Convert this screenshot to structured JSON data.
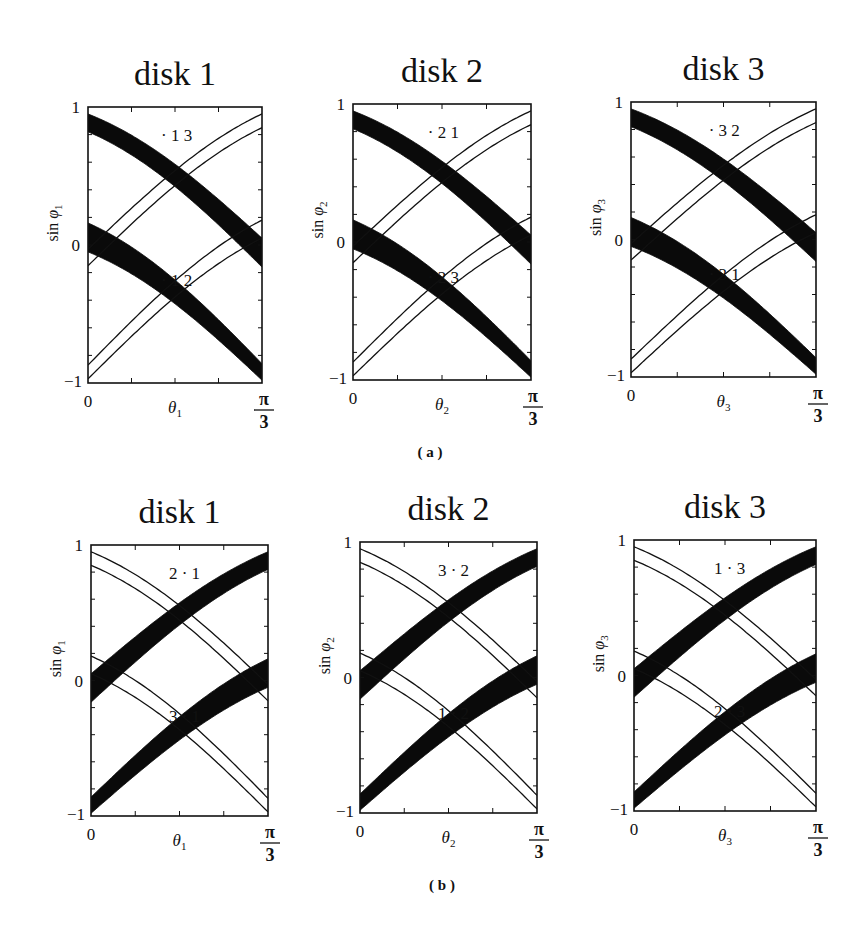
{
  "figure": {
    "captions": [
      {
        "id": "a",
        "text": "( a )",
        "x": 430,
        "y": 457
      },
      {
        "id": "b",
        "text": "( b )",
        "x": 442,
        "y": 890
      }
    ]
  },
  "chart_data": [
    {
      "type": "line",
      "panel_id": "a1",
      "row": "a",
      "title": "disk 1",
      "xlabel": "θ1",
      "xlabel_base": "θ",
      "xlabel_sub": "1",
      "ylabel": "sin φ1",
      "ylabel_base": "sin φ",
      "ylabel_sub": "1",
      "xlim": [
        0,
        "π/3"
      ],
      "ylim": [
        -1,
        1
      ],
      "xtick_labels": [
        "0",
        "π/3"
      ],
      "ytick_labels": [
        "1",
        "0",
        "−1"
      ],
      "x_ticks_count": 5,
      "y_ticks_count": 11,
      "frame": {
        "x": 88,
        "y": 107,
        "w": 174,
        "h": 276
      },
      "annotations": [
        {
          "text": "· 1 3",
          "x": 0.42,
          "y": 0.8
        },
        {
          "text": "· 1 2",
          "x": 0.42,
          "y": -0.25
        }
      ],
      "series": [
        {
          "name": "thick band upper",
          "kind": "band",
          "dir": "down",
          "y0": [
            0.95,
            0.82
          ],
          "y1": [
            0.05,
            -0.16
          ]
        },
        {
          "name": "thick band lower",
          "kind": "band",
          "dir": "down",
          "y0": [
            0.16,
            -0.05
          ],
          "y1": [
            -0.86,
            -0.98
          ]
        },
        {
          "name": "thin line upper A",
          "kind": "line",
          "dir": "up",
          "y0": -0.03,
          "y1": 0.95
        },
        {
          "name": "thin line upper B",
          "kind": "line",
          "dir": "up",
          "y0": -0.15,
          "y1": 0.85
        },
        {
          "name": "thin line lower A",
          "kind": "line",
          "dir": "up",
          "y0": -0.87,
          "y1": 0.18
        },
        {
          "name": "thin line lower B",
          "kind": "line",
          "dir": "up",
          "y0": -0.97,
          "y1": 0.05
        }
      ]
    },
    {
      "type": "line",
      "panel_id": "a2",
      "row": "a",
      "title": "disk 2",
      "xlabel": "θ2",
      "xlabel_base": "θ",
      "xlabel_sub": "2",
      "ylabel": "sin φ2",
      "ylabel_base": "sin φ",
      "ylabel_sub": "2",
      "xlim": [
        0,
        "π/3"
      ],
      "ylim": [
        -1,
        1
      ],
      "xtick_labels": [
        "0",
        "π/3"
      ],
      "ytick_labels": [
        "1",
        "0",
        "−1"
      ],
      "x_ticks_count": 5,
      "y_ticks_count": 11,
      "frame": {
        "x": 353,
        "y": 104,
        "w": 178,
        "h": 276
      },
      "annotations": [
        {
          "text": "· 2 1",
          "x": 0.42,
          "y": 0.8
        },
        {
          "text": "· 2 3",
          "x": 0.42,
          "y": -0.25
        }
      ],
      "series": [
        {
          "name": "thick band upper",
          "kind": "band",
          "dir": "down",
          "y0": [
            0.95,
            0.82
          ],
          "y1": [
            0.05,
            -0.16
          ]
        },
        {
          "name": "thick band lower",
          "kind": "band",
          "dir": "down",
          "y0": [
            0.16,
            -0.05
          ],
          "y1": [
            -0.86,
            -0.98
          ]
        },
        {
          "name": "thin line upper A",
          "kind": "line",
          "dir": "up",
          "y0": -0.03,
          "y1": 0.95
        },
        {
          "name": "thin line upper B",
          "kind": "line",
          "dir": "up",
          "y0": -0.15,
          "y1": 0.85
        },
        {
          "name": "thin line lower A",
          "kind": "line",
          "dir": "up",
          "y0": -0.87,
          "y1": 0.18
        },
        {
          "name": "thin line lower B",
          "kind": "line",
          "dir": "up",
          "y0": -0.97,
          "y1": 0.05
        }
      ]
    },
    {
      "type": "line",
      "panel_id": "a3",
      "row": "a",
      "title": "disk 3",
      "xlabel": "θ3",
      "xlabel_base": "θ",
      "xlabel_sub": "3",
      "ylabel": "sin φ3",
      "ylabel_base": "sin φ",
      "ylabel_sub": "3",
      "xlim": [
        0,
        "π/3"
      ],
      "ylim": [
        -1,
        1
      ],
      "xtick_labels": [
        "0",
        "π/3"
      ],
      "ytick_labels": [
        "1",
        "0",
        "−1"
      ],
      "x_ticks_count": 5,
      "y_ticks_count": 11,
      "frame": {
        "x": 631,
        "y": 102,
        "w": 185,
        "h": 275
      },
      "annotations": [
        {
          "text": "· 3 2",
          "x": 0.42,
          "y": 0.8
        },
        {
          "text": "· 3 1",
          "x": 0.42,
          "y": -0.25
        }
      ],
      "series": [
        {
          "name": "thick band upper",
          "kind": "band",
          "dir": "down",
          "y0": [
            0.95,
            0.82
          ],
          "y1": [
            0.05,
            -0.16
          ]
        },
        {
          "name": "thick band lower",
          "kind": "band",
          "dir": "down",
          "y0": [
            0.16,
            -0.05
          ],
          "y1": [
            -0.86,
            -0.98
          ]
        },
        {
          "name": "thin line upper A",
          "kind": "line",
          "dir": "up",
          "y0": -0.03,
          "y1": 0.95
        },
        {
          "name": "thin line upper B",
          "kind": "line",
          "dir": "up",
          "y0": -0.15,
          "y1": 0.85
        },
        {
          "name": "thin line lower A",
          "kind": "line",
          "dir": "up",
          "y0": -0.87,
          "y1": 0.18
        },
        {
          "name": "thin line lower B",
          "kind": "line",
          "dir": "up",
          "y0": -0.97,
          "y1": 0.05
        }
      ]
    },
    {
      "type": "line",
      "panel_id": "b1",
      "row": "b",
      "title": "disk 1",
      "xlabel": "θ1",
      "xlabel_base": "θ",
      "xlabel_sub": "1",
      "ylabel": "sin φ1",
      "ylabel_base": "sin φ",
      "ylabel_sub": "1",
      "xlim": [
        0,
        "π/3"
      ],
      "ylim": [
        -1,
        1
      ],
      "xtick_labels": [
        "0",
        "π/3"
      ],
      "ytick_labels": [
        "1",
        "0",
        "−1"
      ],
      "x_ticks_count": 5,
      "y_ticks_count": 11,
      "frame": {
        "x": 91,
        "y": 545,
        "w": 177,
        "h": 271
      },
      "annotations": [
        {
          "text": "2 · 1",
          "x": 0.44,
          "y": 0.79
        },
        {
          "text": "3 · 1",
          "x": 0.44,
          "y": -0.26
        }
      ],
      "series": [
        {
          "name": "thick band upper",
          "kind": "band",
          "dir": "up",
          "y0": [
            0.05,
            -0.16
          ],
          "y1": [
            0.95,
            0.82
          ]
        },
        {
          "name": "thick band lower",
          "kind": "band",
          "dir": "up",
          "y0": [
            -0.86,
            -0.98
          ],
          "y1": [
            0.16,
            -0.05
          ]
        },
        {
          "name": "thin line upper A",
          "kind": "line",
          "dir": "down",
          "y0": 0.95,
          "y1": -0.03
        },
        {
          "name": "thin line upper B",
          "kind": "line",
          "dir": "down",
          "y0": 0.85,
          "y1": -0.15
        },
        {
          "name": "thin line lower A",
          "kind": "line",
          "dir": "down",
          "y0": 0.18,
          "y1": -0.87
        },
        {
          "name": "thin line lower B",
          "kind": "line",
          "dir": "down",
          "y0": 0.05,
          "y1": -0.97
        }
      ]
    },
    {
      "type": "line",
      "panel_id": "b2",
      "row": "b",
      "title": "disk 2",
      "xlabel": "θ2",
      "xlabel_base": "θ",
      "xlabel_sub": "2",
      "ylabel": "sin φ2",
      "ylabel_base": "sin φ",
      "ylabel_sub": "2",
      "xlim": [
        0,
        "π/3"
      ],
      "ylim": [
        -1,
        1
      ],
      "xtick_labels": [
        "0",
        "π/3"
      ],
      "ytick_labels": [
        "1",
        "0",
        "−1"
      ],
      "x_ticks_count": 5,
      "y_ticks_count": 11,
      "frame": {
        "x": 360,
        "y": 542,
        "w": 177,
        "h": 271
      },
      "annotations": [
        {
          "text": "3 · 2",
          "x": 0.44,
          "y": 0.79
        },
        {
          "text": "1 · 2",
          "x": 0.44,
          "y": -0.26
        }
      ],
      "series": [
        {
          "name": "thick band upper",
          "kind": "band",
          "dir": "up",
          "y0": [
            0.05,
            -0.16
          ],
          "y1": [
            0.95,
            0.82
          ]
        },
        {
          "name": "thick band lower",
          "kind": "band",
          "dir": "up",
          "y0": [
            -0.86,
            -0.98
          ],
          "y1": [
            0.16,
            -0.05
          ]
        },
        {
          "name": "thin line upper A",
          "kind": "line",
          "dir": "down",
          "y0": 0.95,
          "y1": -0.03
        },
        {
          "name": "thin line upper B",
          "kind": "line",
          "dir": "down",
          "y0": 0.85,
          "y1": -0.15
        },
        {
          "name": "thin line lower A",
          "kind": "line",
          "dir": "down",
          "y0": 0.18,
          "y1": -0.87
        },
        {
          "name": "thin line lower B",
          "kind": "line",
          "dir": "down",
          "y0": 0.05,
          "y1": -0.97
        }
      ]
    },
    {
      "type": "line",
      "panel_id": "b3",
      "row": "b",
      "title": "disk 3",
      "xlabel": "θ3",
      "xlabel_base": "θ",
      "xlabel_sub": "3",
      "ylabel": "sin φ3",
      "ylabel_base": "sin φ",
      "ylabel_sub": "3",
      "xlim": [
        0,
        "π/3"
      ],
      "ylim": [
        -1,
        1
      ],
      "xtick_labels": [
        "0",
        "π/3"
      ],
      "ytick_labels": [
        "1",
        "0",
        "−1"
      ],
      "x_ticks_count": 5,
      "y_ticks_count": 11,
      "frame": {
        "x": 634,
        "y": 540,
        "w": 182,
        "h": 271
      },
      "annotations": [
        {
          "text": "1 · 3",
          "x": 0.44,
          "y": 0.79
        },
        {
          "text": "2 · 3",
          "x": 0.44,
          "y": -0.26
        }
      ],
      "series": [
        {
          "name": "thick band upper",
          "kind": "band",
          "dir": "up",
          "y0": [
            0.05,
            -0.16
          ],
          "y1": [
            0.95,
            0.82
          ]
        },
        {
          "name": "thick band lower",
          "kind": "band",
          "dir": "up",
          "y0": [
            -0.86,
            -0.98
          ],
          "y1": [
            0.16,
            -0.05
          ]
        },
        {
          "name": "thin line upper A",
          "kind": "line",
          "dir": "down",
          "y0": 0.95,
          "y1": -0.03
        },
        {
          "name": "thin line upper B",
          "kind": "line",
          "dir": "down",
          "y0": 0.85,
          "y1": -0.15
        },
        {
          "name": "thin line lower A",
          "kind": "line",
          "dir": "down",
          "y0": 0.18,
          "y1": -0.87
        },
        {
          "name": "thin line lower B",
          "kind": "line",
          "dir": "down",
          "y0": 0.05,
          "y1": -0.97
        }
      ]
    }
  ]
}
